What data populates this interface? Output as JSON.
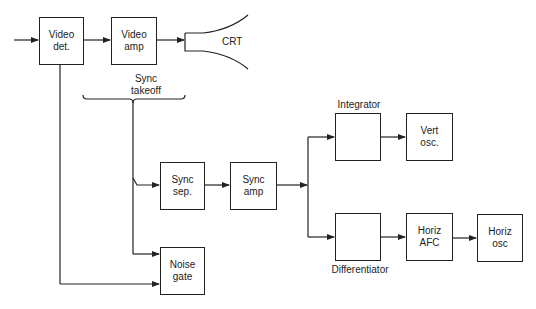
{
  "diagram": {
    "blocks": {
      "video_det": {
        "line1": "Video",
        "line2": "det."
      },
      "video_amp": {
        "line1": "Video",
        "line2": "amp"
      },
      "crt": {
        "label": "CRT"
      },
      "sync_sep": {
        "line1": "Sync",
        "line2": "sep."
      },
      "sync_amp": {
        "line1": "Sync",
        "line2": "amp"
      },
      "noise_gate": {
        "line1": "Noise",
        "line2": "gate"
      },
      "integrator": {
        "line1": "",
        "line2": ""
      },
      "vert_osc": {
        "line1": "Vert",
        "line2": "osc."
      },
      "differentiator": {
        "line1": "",
        "line2": ""
      },
      "horiz_afc": {
        "line1": "Horiz",
        "line2": "AFC"
      },
      "horiz_osc": {
        "line1": "Horiz",
        "line2": "osc"
      }
    },
    "labels": {
      "sync_takeoff_1": "Sync",
      "sync_takeoff_2": "takeoff",
      "integrator": "Integrator",
      "differentiator": "Differentiator"
    },
    "connections": [
      [
        "input",
        "video_det"
      ],
      [
        "video_det",
        "video_amp"
      ],
      [
        "video_amp",
        "crt"
      ],
      [
        "sync_takeoff",
        "sync_sep"
      ],
      [
        "sync_takeoff",
        "noise_gate"
      ],
      [
        "video_det",
        "noise_gate"
      ],
      [
        "sync_sep",
        "sync_amp"
      ],
      [
        "sync_amp",
        "integrator"
      ],
      [
        "sync_amp",
        "differentiator"
      ],
      [
        "integrator",
        "vert_osc"
      ],
      [
        "differentiator",
        "horiz_afc"
      ],
      [
        "horiz_afc",
        "horiz_osc"
      ]
    ]
  }
}
